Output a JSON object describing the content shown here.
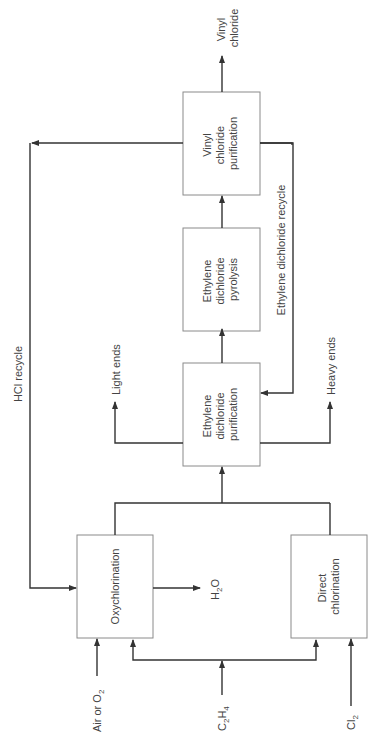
{
  "diagram": {
    "type": "process-flow",
    "orientation": "rotated-90-ccw",
    "colors": {
      "line": "#333333",
      "box_border": "#8a8a8a",
      "text": "#444444",
      "background": "#ffffff"
    },
    "nodes": {
      "vinyl_chloride_purification": {
        "lines": [
          "Vinyl",
          "chloride",
          "purification"
        ]
      },
      "edc_pyrolysis": {
        "lines": [
          "Ethylene",
          "dichloride",
          "pyrolysis"
        ]
      },
      "edc_purification": {
        "lines": [
          "Ethylene",
          "dichloride",
          "purification"
        ]
      },
      "oxychlorination": {
        "lines": [
          "Oxychlorination"
        ]
      },
      "direct_chlorination": {
        "lines": [
          "Direct",
          "chlorination"
        ]
      }
    },
    "streams": {
      "vinyl_chloride_product": {
        "lines": [
          "Vinyl",
          "chloride"
        ]
      },
      "hcl_recycle": "HCl recycle",
      "edc_recycle": "Ethylene dichloride recycle",
      "light_ends": "Light ends",
      "heavy_ends": "Heavy ends",
      "water": {
        "main": "H",
        "sub": "2",
        "tail": "O"
      },
      "air_or_o2": {
        "main": "Air or O",
        "sub": "2"
      },
      "ethylene": {
        "a": "C",
        "a_sub": "2",
        "b": "H",
        "b_sub": "4"
      },
      "chlorine": {
        "main": "Cl",
        "sub": "2"
      }
    },
    "edges": [
      [
        "Air or O2",
        "Oxychlorination"
      ],
      [
        "C2H4",
        "Oxychlorination"
      ],
      [
        "C2H4",
        "Direct chlorination"
      ],
      [
        "Cl2",
        "Direct chlorination"
      ],
      [
        "Oxychlorination",
        "H2O"
      ],
      [
        "Oxychlorination",
        "Ethylene dichloride purification"
      ],
      [
        "Direct chlorination",
        "Ethylene dichloride purification"
      ],
      [
        "Ethylene dichloride purification",
        "Light ends"
      ],
      [
        "Ethylene dichloride purification",
        "Heavy ends"
      ],
      [
        "Ethylene dichloride purification",
        "Ethylene dichloride pyrolysis"
      ],
      [
        "Ethylene dichloride pyrolysis",
        "Vinyl chloride purification"
      ],
      [
        "Vinyl chloride purification",
        "Vinyl chloride"
      ],
      [
        "Vinyl chloride purification",
        "Oxychlorination (HCl recycle)"
      ],
      [
        "Vinyl chloride purification",
        "Ethylene dichloride purification (EDC recycle)"
      ]
    ]
  }
}
